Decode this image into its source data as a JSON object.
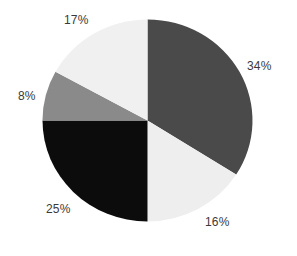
{
  "chart_data": {
    "type": "pie",
    "title": "",
    "start_angle_deg": 0,
    "direction": "clockwise",
    "slices": [
      {
        "label": "34%",
        "value": 34,
        "color": "#4a4a4a"
      },
      {
        "label": "16%",
        "value": 16,
        "color": "#eeeeee"
      },
      {
        "label": "25%",
        "value": 25,
        "color": "#0c0c0c"
      },
      {
        "label": "8%",
        "value": 8,
        "color": "#8a8a8a"
      },
      {
        "label": "17%",
        "value": 17,
        "color": "#f0f0f0"
      }
    ],
    "values": [
      34,
      16,
      25,
      8,
      17
    ],
    "categories": [
      "34%",
      "16%",
      "25%",
      "8%",
      "17%"
    ],
    "legend": "none",
    "data_labels": "outside, percentage"
  },
  "labels": {
    "s34": "34%",
    "s16": "16%",
    "s25": "25%",
    "s8": "8%",
    "s17": "17%"
  }
}
